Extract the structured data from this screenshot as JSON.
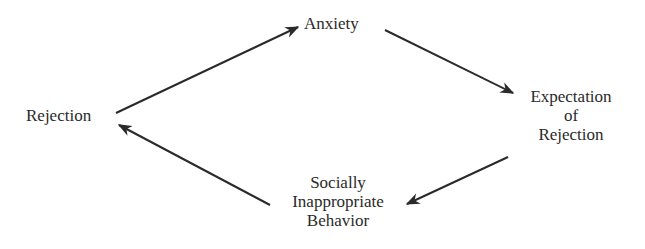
{
  "diagram": {
    "type": "cycle",
    "nodes": {
      "rejection": {
        "lines": [
          "Rejection"
        ]
      },
      "anxiety": {
        "lines": [
          "Anxiety"
        ]
      },
      "expectation": {
        "lines": [
          "Expectation",
          "of",
          "Rejection"
        ]
      },
      "behavior": {
        "lines": [
          "Socially",
          "Inappropriate",
          "Behavior"
        ]
      }
    },
    "edges": [
      {
        "from": "Rejection",
        "to": "Anxiety"
      },
      {
        "from": "Anxiety",
        "to": "Expectation of Rejection"
      },
      {
        "from": "Expectation of Rejection",
        "to": "Socially Inappropriate Behavior"
      },
      {
        "from": "Socially Inappropriate Behavior",
        "to": "Rejection"
      }
    ],
    "colors": {
      "ink": "#2a2a2a",
      "background": "#ffffff"
    }
  }
}
